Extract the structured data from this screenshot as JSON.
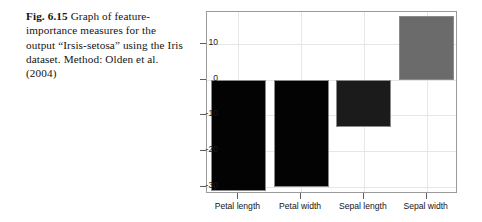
{
  "caption": {
    "figure_label": "Fig. 6.15",
    "text": "Graph of feature-importance measures for the output “Irsis-setosa” using the Iris dataset. Method: Olden et al. (2004)"
  },
  "chart_data": {
    "type": "bar",
    "title": "",
    "xlabel": "",
    "ylabel": "Importance",
    "categories": [
      "Petal length",
      "Petal width",
      "Sepal length",
      "Sepal width"
    ],
    "values": [
      -31.2,
      -30.0,
      -13.2,
      17.9
    ],
    "ylim": [
      -32,
      19
    ],
    "yticks": [
      10,
      0,
      -10,
      -20,
      -30
    ],
    "ytick_labels": [
      "10",
      "0",
      "-10",
      "-20",
      "-30"
    ],
    "grid": true,
    "legend": false,
    "bar_colors": [
      "#030303",
      "#030303",
      "#1b1b1b",
      "#6b6b6b"
    ],
    "bar_edge_colors": [
      "#8a8a8a",
      "#8a8a8a",
      "#8a8a8a",
      "#8a8a8a"
    ],
    "axis_color": "#9a9a9a",
    "grid_color": "#e6e6e6"
  }
}
